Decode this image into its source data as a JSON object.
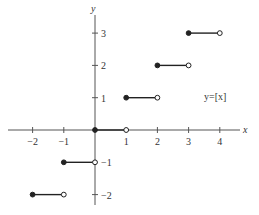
{
  "chart_data": {
    "type": "line",
    "title": "",
    "function_label": "y=[x]",
    "xlabel": "x",
    "ylabel": "y",
    "xlim": [
      -2.5,
      4.6
    ],
    "ylim": [
      -2.5,
      3.5
    ],
    "grid": false,
    "x_ticks": [
      -2,
      -1,
      1,
      2,
      3,
      4
    ],
    "x_tick_labels": [
      "−2",
      "−1",
      "1",
      "2",
      "3",
      "4"
    ],
    "y_ticks": [
      -2,
      -1,
      1,
      2,
      3
    ],
    "y_tick_labels": [
      "−2",
      "−1",
      "1",
      "2",
      "3"
    ],
    "segments": [
      {
        "x_start": -2,
        "x_end": -1,
        "y": -2,
        "start_closed": true,
        "end_closed": false
      },
      {
        "x_start": -1,
        "x_end": 0,
        "y": -1,
        "start_closed": true,
        "end_closed": false
      },
      {
        "x_start": 0,
        "x_end": 1,
        "y": 0,
        "start_closed": true,
        "end_closed": false
      },
      {
        "x_start": 1,
        "x_end": 2,
        "y": 1,
        "start_closed": true,
        "end_closed": false
      },
      {
        "x_start": 2,
        "x_end": 3,
        "y": 2,
        "start_closed": true,
        "end_closed": false
      },
      {
        "x_start": 3,
        "x_end": 4,
        "y": 3,
        "start_closed": true,
        "end_closed": false
      }
    ],
    "colors": {
      "axis": "#555555",
      "line": "#222222",
      "text": "#333333"
    }
  }
}
